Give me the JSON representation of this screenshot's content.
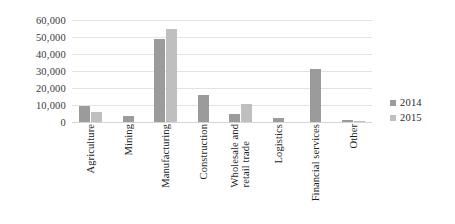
{
  "chart_data": {
    "type": "bar",
    "title": "",
    "subtitle": "",
    "xlabel": "",
    "ylabel": "",
    "ylim": [
      0,
      60000
    ],
    "ytick_labels": [
      "60,000",
      "50,000",
      "40,000",
      "30,000",
      "20,000",
      "10,000",
      "0"
    ],
    "ytick_values": [
      60000,
      50000,
      40000,
      30000,
      20000,
      10000,
      0
    ],
    "grid": true,
    "legend_position": "right",
    "categories": [
      "Agriculture",
      "Mining",
      "Manufacturing",
      "Construction",
      "Wholesale and\nretail trade",
      "Logistics",
      "Financial services",
      "Other"
    ],
    "series": [
      {
        "name": "2014",
        "color": "#9b9b9b",
        "values": [
          9500,
          3500,
          49000,
          16000,
          5000,
          2500,
          31000,
          1000
        ]
      },
      {
        "name": "2015",
        "color": "#bfbfbf",
        "values": [
          6000,
          0,
          54500,
          0,
          10500,
          0,
          0,
          800
        ]
      }
    ]
  },
  "legend": {
    "items": [
      {
        "label": "2014",
        "series": "s2014"
      },
      {
        "label": "2015",
        "series": "s2015"
      }
    ]
  }
}
